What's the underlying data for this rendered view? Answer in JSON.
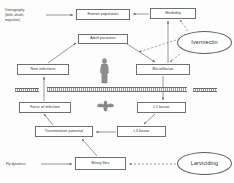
{
  "diagram": {
    "colors": {
      "box_border": "#6f6f6f",
      "ellipse_border": "#5d5d5d",
      "text": "#2b2b2b",
      "arrow": "#555555",
      "background": "#fdfdfd"
    },
    "nodes": {
      "demography": "Demography\n(birth, death,\nmigration)",
      "human_population": "Human population",
      "morbidity": "Morbidity",
      "ivermectin": "Ivermectin",
      "adult_parasites": "Adult parasites",
      "new_infections": "New infections",
      "microfilariae": "Microfilariae",
      "force_of_infection": "Force of infection",
      "l1_larvae": "L1 larvae",
      "l3_larvae": "L3 larvae",
      "transmission_potential": "Transmission potential",
      "fly_dynamics": "Fly dynamics",
      "biting_flies": "Biting flies",
      "larviciding": "Larviciding"
    },
    "figures": {
      "human": "human-figure",
      "fly": "blackfly-figure",
      "divider": "host-vector-divider-band"
    },
    "edges": [
      {
        "from": "demography",
        "to": "human_population",
        "style": "solid"
      },
      {
        "from": "morbidity",
        "to": "human_population",
        "style": "solid"
      },
      {
        "from": "microfilariae",
        "to": "morbidity",
        "style": "solid"
      },
      {
        "from": "new_infections",
        "to": "adult_parasites",
        "style": "solid"
      },
      {
        "from": "adult_parasites",
        "to": "microfilariae",
        "style": "solid"
      },
      {
        "from": "microfilariae",
        "to": "l1_larvae",
        "style": "solid"
      },
      {
        "from": "l1_larvae",
        "to": "l3_larvae",
        "style": "solid"
      },
      {
        "from": "l3_larvae",
        "to": "transmission_potential",
        "style": "solid"
      },
      {
        "from": "transmission_potential",
        "to": "force_of_infection",
        "style": "solid"
      },
      {
        "from": "force_of_infection",
        "to": "new_infections",
        "style": "solid"
      },
      {
        "from": "fly_dynamics",
        "to": "biting_flies",
        "style": "solid"
      },
      {
        "from": "biting_flies",
        "to": "transmission_potential",
        "style": "solid"
      },
      {
        "from": "ivermectin",
        "to": "microfilariae",
        "style": "dashed"
      },
      {
        "from": "ivermectin",
        "to": "adult_parasites",
        "style": "dashed"
      },
      {
        "from": "ivermectin",
        "to": "morbidity",
        "style": "dashed"
      },
      {
        "from": "larviciding",
        "to": "biting_flies",
        "style": "dashed"
      }
    ]
  }
}
